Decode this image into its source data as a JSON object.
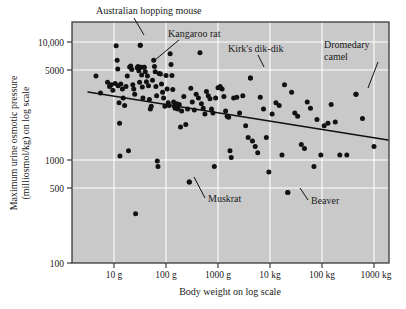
{
  "figure": {
    "type": "scatter-plot",
    "background_color": "#c9c9c9",
    "gridline_color": "#ffffff",
    "point_color": "#111111",
    "trendline_color": "#111111"
  },
  "axes": {
    "x_title": "Body weight on log scale",
    "y_title_line1": "Maximum urine osmotic pressure",
    "y_title_line2": "(milliosmol/kg) on log scale",
    "x_ticks": [
      "10 g",
      "100 g",
      "1000 g",
      "10 kg",
      "100 kg",
      "1000 kg"
    ],
    "y_ticks": [
      "10,000",
      "5000",
      "1000",
      "500",
      "100"
    ]
  },
  "annotations": [
    {
      "id": "australian-hopping-mouse",
      "label": "Australian hopping mouse"
    },
    {
      "id": "kangaroo-rat",
      "label": "Kangaroo rat"
    },
    {
      "id": "kirks-dik-dik",
      "label": "Kirk's dik-dik"
    },
    {
      "id": "dromedary-camel-line1",
      "label": "Dromedary"
    },
    {
      "id": "dromedary-camel-line2",
      "label": "camel"
    },
    {
      "id": "muskrat",
      "label": "Muskrat"
    },
    {
      "id": "beaver",
      "label": "Beaver"
    }
  ],
  "chart_data": {
    "type": "scatter",
    "title": "",
    "xlabel": "Body weight on log scale",
    "ylabel": "Maximum urine osmotic pressure (milliosmol/kg) on log scale",
    "xscale": "log",
    "yscale": "log",
    "xlim": [
      3,
      2000000
    ],
    "ylim": [
      100,
      20000
    ],
    "x_tick_values": [
      10,
      100,
      1000,
      10000,
      100000,
      1000000
    ],
    "x_tick_labels": [
      "10 g",
      "100 g",
      "1000 g",
      "10 kg",
      "100 kg",
      "1000 kg"
    ],
    "y_tick_values": [
      10000,
      5000,
      1000,
      500,
      100
    ],
    "y_tick_labels": [
      "10,000",
      "5000",
      "1000",
      "500",
      "100"
    ],
    "grid": true,
    "legend": "none",
    "trendline": {
      "type": "linear-on-log-log",
      "x_start_g": 4.5,
      "y_start_mosm": 4600,
      "x_end_g": 1000000,
      "y_end_mosm": 1300
    },
    "labeled_points": [
      {
        "name": "Australian hopping mouse",
        "x_g": 32,
        "y_mosm": 9400
      },
      {
        "name": "Kangaroo rat",
        "x_g": 38,
        "y_mosm": 6100
      },
      {
        "name": "Kirk's dik-dik",
        "x_g": 4200,
        "y_mosm": 4950
      },
      {
        "name": "Dromedary camel",
        "x_g": 450000,
        "y_mosm": 3600
      },
      {
        "name": "Muskrat",
        "x_g": 280,
        "y_mosm": 650
      },
      {
        "name": "Beaver",
        "x_g": 22000,
        "y_mosm": 530
      }
    ],
    "points": [
      [
        4.5,
        5150
      ],
      [
        5.5,
        3700
      ],
      [
        7.5,
        4550
      ],
      [
        8.2,
        4200
      ],
      [
        8.8,
        4350
      ],
      [
        9.5,
        3900
      ],
      [
        10.5,
        4450
      ],
      [
        11.0,
        9300
      ],
      [
        11.5,
        7000
      ],
      [
        11.8,
        5900
      ],
      [
        12.0,
        4250
      ],
      [
        12.5,
        3050
      ],
      [
        12.8,
        2050
      ],
      [
        13.0,
        1080
      ],
      [
        13.5,
        4400
      ],
      [
        14.5,
        4000
      ],
      [
        15.0,
        3350
      ],
      [
        16.0,
        2900
      ],
      [
        17.0,
        4200
      ],
      [
        18.0,
        5150
      ],
      [
        19.0,
        1200
      ],
      [
        20.0,
        6150
      ],
      [
        21.0,
        6250
      ],
      [
        22.0,
        5850
      ],
      [
        23.0,
        4350
      ],
      [
        24.0,
        4000
      ],
      [
        25.0,
        3600
      ],
      [
        26.0,
        350
      ],
      [
        28.0,
        6050
      ],
      [
        29.0,
        6200
      ],
      [
        30.0,
        5700
      ],
      [
        31.0,
        4550
      ],
      [
        32.0,
        9400
      ],
      [
        33.0,
        6100
      ],
      [
        34.0,
        5250
      ],
      [
        35.0,
        4150
      ],
      [
        36.0,
        3350
      ],
      [
        38.0,
        6100
      ],
      [
        40.0,
        5600
      ],
      [
        42.0,
        4600
      ],
      [
        44.0,
        5150
      ],
      [
        46.0,
        4250
      ],
      [
        48.0,
        3250
      ],
      [
        50.0,
        2700
      ],
      [
        52.0,
        2850
      ],
      [
        55.0,
        4750
      ],
      [
        58.0,
        7000
      ],
      [
        60.0,
        6200
      ],
      [
        62.0,
        5600
      ],
      [
        64.0,
        4200
      ],
      [
        66.0,
        3500
      ],
      [
        68.0,
        980
      ],
      [
        70.0,
        880
      ],
      [
        74.0,
        5400
      ],
      [
        78.0,
        5350
      ],
      [
        82.0,
        4400
      ],
      [
        86.0,
        3750
      ],
      [
        90.0,
        3350
      ],
      [
        95.0,
        2850
      ],
      [
        100.0,
        5200
      ],
      [
        105.0,
        4000
      ],
      [
        110.0,
        3050
      ],
      [
        115.0,
        2900
      ],
      [
        120.0,
        7950
      ],
      [
        125.0,
        6450
      ],
      [
        130.0,
        5200
      ],
      [
        135.0,
        3950
      ],
      [
        140.0,
        3100
      ],
      [
        145.0,
        2850
      ],
      [
        150.0,
        2750
      ],
      [
        160.0,
        3000
      ],
      [
        170.0,
        2700
      ],
      [
        180.0,
        2950
      ],
      [
        190.0,
        1900
      ],
      [
        200.0,
        2600
      ],
      [
        220.0,
        3450
      ],
      [
        240.0,
        2000
      ],
      [
        260.0,
        2700
      ],
      [
        280.0,
        650
      ],
      [
        300.0,
        4050
      ],
      [
        320.0,
        3100
      ],
      [
        350.0,
        2650
      ],
      [
        380.0,
        3600
      ],
      [
        420.0,
        3350
      ],
      [
        450.0,
        8100
      ],
      [
        480.0,
        3000
      ],
      [
        520.0,
        2750
      ],
      [
        560.0,
        2450
      ],
      [
        600.0,
        3800
      ],
      [
        650.0,
        3500
      ],
      [
        700.0,
        3300
      ],
      [
        750.0,
        2700
      ],
      [
        800.0,
        2500
      ],
      [
        850.0,
        880
      ],
      [
        900.0,
        3350
      ],
      [
        1000.0,
        4100
      ],
      [
        1100.0,
        4200
      ],
      [
        1200.0,
        4000
      ],
      [
        1300.0,
        3450
      ],
      [
        1400.0,
        2600
      ],
      [
        1500.0,
        2350
      ],
      [
        1600.0,
        2300
      ],
      [
        1700.0,
        1200
      ],
      [
        1800.0,
        1050
      ],
      [
        2000.0,
        3350
      ],
      [
        2300.0,
        3400
      ],
      [
        2600.0,
        2500
      ],
      [
        3000.0,
        3500
      ],
      [
        3400.0,
        1950
      ],
      [
        3800.0,
        1550
      ],
      [
        4200.0,
        4950
      ],
      [
        4600.0,
        1450
      ],
      [
        5200.0,
        1300
      ],
      [
        5800.0,
        1150
      ],
      [
        6500.0,
        3400
      ],
      [
        7500.0,
        2700
      ],
      [
        8500.0,
        1550
      ],
      [
        9500.0,
        790
      ],
      [
        11000.0,
        2450
      ],
      [
        13000.0,
        3050
      ],
      [
        15000.0,
        2900
      ],
      [
        17000.0,
        1100
      ],
      [
        19000.0,
        4350
      ],
      [
        22000.0,
        530
      ],
      [
        26000.0,
        3750
      ],
      [
        30000.0,
        2500
      ],
      [
        34000.0,
        2350
      ],
      [
        40000.0,
        1350
      ],
      [
        46000.0,
        1250
      ],
      [
        52000.0,
        3100
      ],
      [
        60000.0,
        2750
      ],
      [
        70000.0,
        880
      ],
      [
        80000.0,
        2200
      ],
      [
        95000.0,
        1100
      ],
      [
        110000.0,
        1950
      ],
      [
        130000.0,
        2050
      ],
      [
        150000.0,
        2950
      ],
      [
        180000.0,
        2100
      ],
      [
        220000.0,
        1100
      ],
      [
        300000.0,
        1100
      ],
      [
        450000.0,
        3600
      ],
      [
        600000.0,
        2250
      ],
      [
        1000000.0,
        1300
      ]
    ]
  }
}
